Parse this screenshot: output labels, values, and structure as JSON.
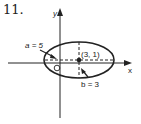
{
  "problem": {
    "number": "11."
  },
  "axes": {
    "x_label": "x",
    "y_label": "y"
  },
  "ellipse": {
    "center_label": "(3, 1)",
    "center": [
      3,
      1
    ],
    "a_label": "a = 5",
    "b_label": "b = 3",
    "a": 5,
    "b": 3
  },
  "colors": {
    "ink": "#222222",
    "background": "#ffffff"
  }
}
